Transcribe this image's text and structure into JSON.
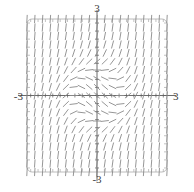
{
  "figure": {
    "width": 194,
    "height": 192,
    "background": "#ffffff"
  },
  "labels": {
    "top": "3",
    "bottom": "-3",
    "left": "-3",
    "right": "3"
  },
  "chart_data": {
    "type": "scatter",
    "plot_kind": "slope-field",
    "title": "",
    "xlabel": "",
    "ylabel": "",
    "xlim": [
      -3,
      3
    ],
    "ylim": [
      -3,
      3
    ],
    "grid": false,
    "axes_shown": [
      "x-axis at y=0",
      "y-axis at x=0"
    ],
    "tick_labels": {
      "x": [
        "-3",
        "3"
      ],
      "y": [
        "-3",
        "3"
      ]
    },
    "frame": {
      "shape": "rounded-rectangle",
      "color": "#b4b4b4",
      "corner_radius_px": 5,
      "left_px": 27,
      "top_px": 19,
      "right_px": 167,
      "bottom_px": 172
    },
    "axis_style": {
      "color": "#5a5a5a",
      "tick_count_per_axis": 19,
      "tick_length_px": 3
    },
    "segment_style": {
      "color": "#8a8a8a",
      "width_px": 0.9,
      "length_px": 7.4
    },
    "grid_dims": {
      "columns": 19,
      "rows": 19,
      "x_start": -3,
      "x_step": 0.3333333333,
      "y_start": -3,
      "y_step": 0.3333333333
    },
    "slope_formula": "dy/dx = x^2 + y^2 - 1",
    "legend": null,
    "annotations": []
  }
}
